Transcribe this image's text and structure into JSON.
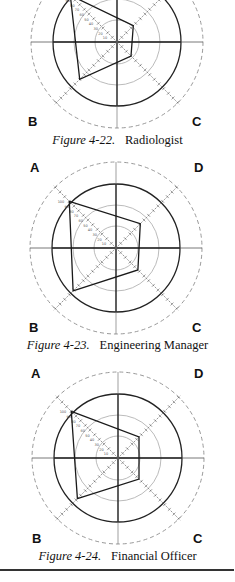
{
  "figures": [
    {
      "number": "Figure 4-22.",
      "title": "Radiologist",
      "corners": {
        "A": "A",
        "B": "B",
        "C": "C",
        "D": "D"
      }
    },
    {
      "number": "Figure 4-23.",
      "title": "Engineering Manager",
      "corners": {
        "A": "A",
        "B": "B",
        "C": "C",
        "D": "D"
      }
    },
    {
      "number": "Figure 4-24.",
      "title": "Financial Officer",
      "corners": {
        "A": "A",
        "B": "B",
        "C": "C",
        "D": "D"
      }
    }
  ],
  "chart_data": [
    {
      "type": "radar",
      "title": "Figure 4-22. Radiologist",
      "axes": [
        "A",
        "D",
        "C",
        "B"
      ],
      "scale_ticks": [
        10,
        20,
        30,
        40,
        50,
        60,
        70,
        80,
        90,
        100
      ],
      "rlim": [
        0,
        100
      ],
      "values": {
        "A": 100,
        "D": 35,
        "C": 30,
        "B": 80
      },
      "grid": "concentric circles + crosshair"
    },
    {
      "type": "radar",
      "title": "Figure 4-23. Engineering Manager",
      "axes": [
        "A",
        "D",
        "C",
        "B"
      ],
      "scale_ticks": [
        10,
        20,
        30,
        40,
        50,
        60,
        70,
        80,
        90,
        100
      ],
      "rlim": [
        0,
        100
      ],
      "values": {
        "A": 100,
        "D": 52,
        "C": 47,
        "B": 92
      },
      "grid": "concentric circles + crosshair"
    },
    {
      "type": "radar",
      "title": "Figure 4-24. Financial Officer",
      "axes": [
        "A",
        "D",
        "C",
        "B"
      ],
      "scale_ticks": [
        10,
        20,
        30,
        40,
        50,
        60,
        70,
        80,
        90,
        100
      ],
      "rlim": [
        0,
        100
      ],
      "values": {
        "A": 100,
        "D": 45,
        "C": 45,
        "B": 87
      },
      "grid": "concentric circles + crosshair"
    }
  ]
}
